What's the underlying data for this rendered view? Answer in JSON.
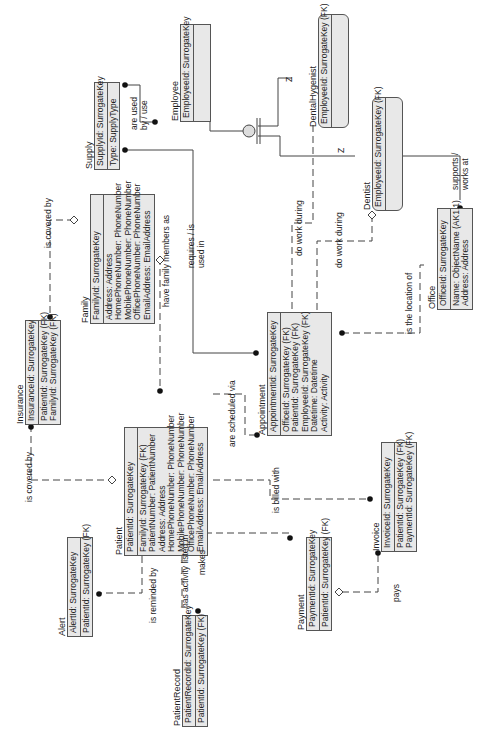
{
  "diagram": {
    "type": "entity-relationship",
    "orientation": "rotated-90-ccw",
    "colors": {
      "entity_fill": "#e8e8e8",
      "border": "#555555",
      "line": "#444444"
    },
    "entities": {
      "employee": {
        "name": "Employee",
        "keys": [
          "EmployeeId: SurrogateKey"
        ],
        "attributes": []
      },
      "dental_hygenist": {
        "name": "DentalHygenist",
        "keys": [
          "EmployeeId: SurrogateKey (FK)"
        ],
        "attributes": []
      },
      "dentist": {
        "name": "Dentist",
        "keys": [
          "EmployeeId: SurrogateKey (FK)"
        ],
        "attributes": []
      },
      "supply": {
        "name": "Supply",
        "keys": [
          "SupplyId: SurrogateKey"
        ],
        "attributes": [
          "Type: SupplyType"
        ]
      },
      "family": {
        "name": "Family",
        "keys": [
          "FamilyId: SurrogateKey"
        ],
        "attributes": [
          "Address: Address",
          "HomePhoneNumber: PhoneNumber",
          "MobilePhoneNumber: PhoneNumber",
          "OfficePhoneNumber: PhoneNumber",
          "EmailAddress: EmailAddress"
        ]
      },
      "office": {
        "name": "Office",
        "keys": [
          "OfficeId: SurrogateKey"
        ],
        "attributes": [
          "Name: ObjectName (AK1.1)",
          "Address: Address"
        ]
      },
      "insurance": {
        "name": "Insurance",
        "keys": [
          "InsuranceId: SurrogateKey"
        ],
        "attributes": [
          "PatientId: SurrogateKey (FK)",
          "FamilyId: SurrogateKey (FK)"
        ]
      },
      "appointment": {
        "name": "Appointment",
        "keys": [
          "AppointmentId: SurrogateKey"
        ],
        "attributes": [
          "OfficeId: SurrogateKey (FK)",
          "PatientId: SurrogateKey (FK)",
          "EmployeeId: SurrogateKey (FK)",
          "Datetime: Datetime",
          "Activity: Activity"
        ]
      },
      "patient": {
        "name": "Patient",
        "keys": [
          "PatientId: SurrogateKey"
        ],
        "attributes": [
          "FamilyId: SurrogateKey (FK)",
          "PatientNumber: PatientNumber",
          "Address: Address",
          "HomePhoneNumber: PhoneNumber",
          "MobilePhoneNumber: PhoneNumber",
          "OfficePhoneNumber: PhoneNumber",
          "EmailAddress: EmailAddress"
        ]
      },
      "invoice": {
        "name": "Invoice",
        "keys": [
          "InvoiceId: SurrogateKey"
        ],
        "attributes": [
          "PatientId: SurrogateKey (FK)",
          "PaymentId: SurrogateKey (FK)"
        ]
      },
      "alert": {
        "name": "Alert",
        "keys": [
          "AlertId: SurrogateKey"
        ],
        "attributes": [
          "PatientId: SurrogateKey (FK)"
        ]
      },
      "payment": {
        "name": "Payment",
        "keys": [
          "PaymentId: SurrogateKey"
        ],
        "attributes": [
          "PatientId: SurrogateKey (FK)"
        ]
      },
      "patient_record": {
        "name": "PatientRecord",
        "keys": [
          "PatientRecordId: SurrogateKey"
        ],
        "attributes": [
          "PatientId: SurrogateKey (FK)"
        ]
      }
    },
    "relationships": {
      "are_used_by": "are used by / use",
      "is_covered_by_family": "is covered by",
      "is_covered_by_patient": "is covered by",
      "have_family_members": "have family members as",
      "requires": "requires / is used in",
      "do_work_during_hyg": "do work during",
      "do_work_during_dent": "do work during",
      "supports": "supports / works at",
      "is_location_of": "is the location of",
      "are_scheduled_via": "are scheduled via",
      "is_billed_with": "is billed with",
      "is_reminded_by": "is reminded by",
      "has_activity": "has activity listed in",
      "makes": "makes",
      "pays": "pays",
      "subtype_z1": "Z",
      "subtype_z2": "Z"
    }
  }
}
